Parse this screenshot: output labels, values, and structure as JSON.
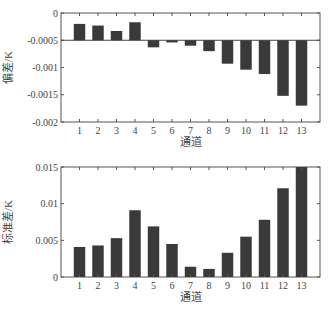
{
  "chart_data": [
    {
      "type": "bar",
      "title": "",
      "xlabel": "通道",
      "ylabel": "偏差/K",
      "categories": [
        "1",
        "2",
        "3",
        "4",
        "5",
        "6",
        "7",
        "8",
        "9",
        "10",
        "11",
        "12",
        "13"
      ],
      "values": [
        -0.0002,
        -0.00023,
        -0.00033,
        -0.00017,
        -0.00063,
        -0.00054,
        -0.0006,
        -0.0007,
        -0.00093,
        -0.00104,
        -0.00112,
        -0.00152,
        -0.0017
      ],
      "bar_baseline": -0.0005,
      "ylim": [
        -0.002,
        0
      ],
      "yticks": [
        "0",
        "-0.0005",
        "-0.001",
        "-0.0015",
        "-0.002"
      ],
      "grid": false,
      "bar_color": "#3a3a3a"
    },
    {
      "type": "bar",
      "title": "",
      "xlabel": "通道",
      "ylabel": "标准差/K",
      "categories": [
        "1",
        "2",
        "3",
        "4",
        "5",
        "6",
        "7",
        "8",
        "9",
        "10",
        "11",
        "12",
        "13"
      ],
      "values": [
        0.0041,
        0.0043,
        0.0053,
        0.0091,
        0.0069,
        0.0045,
        0.0014,
        0.0011,
        0.0033,
        0.0055,
        0.0078,
        0.0121,
        0.015
      ],
      "ylim": [
        0,
        0.015
      ],
      "yticks": [
        "0.015",
        "0.01",
        "0.005",
        "0"
      ],
      "grid": false,
      "bar_color": "#3a3a3a"
    }
  ]
}
